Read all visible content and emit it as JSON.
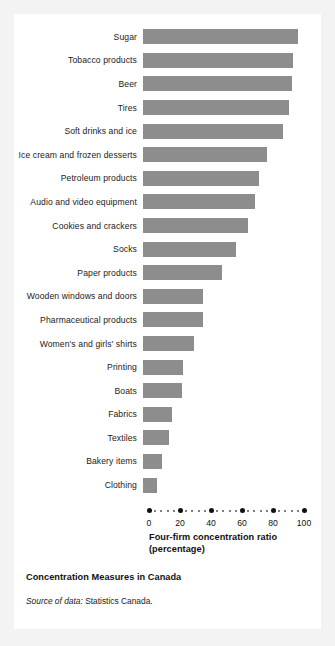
{
  "figure": {
    "caption_title": "Concentration Measures in Canada",
    "source_lead": "Source of data:",
    "source_body": "Statistics Canada.",
    "bar_color": "#8d8d8d",
    "text_color": "#111111",
    "background": "#ffffff"
  },
  "chart_data": {
    "type": "bar",
    "orientation": "horizontal",
    "title": "Concentration Measures in Canada",
    "xlabel": "Four-firm concentration ratio (percentage)",
    "xlabel_line1": "Four-firm concentration ratio",
    "xlabel_line2": "(percentage)",
    "ylabel": "",
    "xlim": [
      0,
      100
    ],
    "xticks": [
      0,
      20,
      40,
      60,
      80,
      100
    ],
    "xticklabels": [
      "0",
      "20",
      "40",
      "60",
      "80",
      "100"
    ],
    "grid": false,
    "legend": false,
    "categories": [
      "Sugar",
      "Tobacco products",
      "Beer",
      "Tires",
      "Soft drinks and ice",
      "Ice cream and frozen desserts",
      "Petroleum products",
      "Audio and video equipment",
      "Cookies and crackers",
      "Socks",
      "Paper products",
      "Wooden windows and doors",
      "Pharmaceutical products",
      "Women's and girls' shirts",
      "Printing",
      "Boats",
      "Fabrics",
      "Textiles",
      "Bakery items",
      "Clothing"
    ],
    "values": [
      100,
      97,
      96,
      94,
      90,
      80,
      75,
      72,
      68,
      60,
      51,
      39,
      39,
      33,
      26,
      25,
      19,
      17,
      12,
      9
    ],
    "series": [
      {
        "name": "Four-firm concentration ratio",
        "values": [
          100,
          97,
          96,
          94,
          90,
          80,
          75,
          72,
          68,
          60,
          51,
          39,
          39,
          33,
          26,
          25,
          19,
          17,
          12,
          9
        ]
      }
    ]
  }
}
